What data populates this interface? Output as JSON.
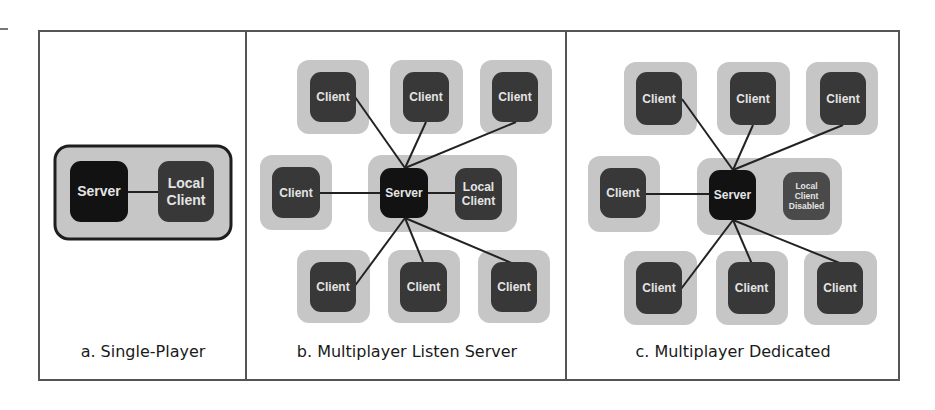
{
  "figure": {
    "colors": {
      "halo": "#c6c6c6",
      "client": "#383838",
      "server": "#121212",
      "disabled": "#4a4a4a",
      "line": "#222222",
      "label": "#e4e4e4",
      "frame": "#555555"
    },
    "panels": [
      {
        "id": "a",
        "caption": "a. Single-Player",
        "caption_x": 40,
        "caption_w": 206,
        "group": {
          "x": 55,
          "y": 146,
          "w": 176,
          "h": 93,
          "bordered": true
        },
        "halos": [],
        "nodes": [
          {
            "role": "server",
            "label": [
              "Server"
            ],
            "x": 70,
            "y": 161,
            "w": 58,
            "h": 61
          },
          {
            "role": "local-client",
            "label": [
              "Local",
              "Client"
            ],
            "x": 158,
            "y": 161,
            "w": 56,
            "h": 61
          }
        ],
        "links": [
          [
            128,
            192,
            158,
            192
          ]
        ]
      },
      {
        "id": "b",
        "caption": "b. Multiplayer Listen Server",
        "caption_x": 248,
        "caption_w": 318,
        "group": {
          "x": 368,
          "y": 155,
          "w": 149,
          "h": 77,
          "bordered": false
        },
        "halos": [
          {
            "x": 297,
            "y": 60,
            "w": 72,
            "h": 74
          },
          {
            "x": 390,
            "y": 60,
            "w": 73,
            "h": 74
          },
          {
            "x": 480,
            "y": 60,
            "w": 72,
            "h": 74
          },
          {
            "x": 260,
            "y": 155,
            "w": 72,
            "h": 75
          },
          {
            "x": 297,
            "y": 250,
            "w": 73,
            "h": 73
          },
          {
            "x": 388,
            "y": 250,
            "w": 72,
            "h": 73
          },
          {
            "x": 478,
            "y": 250,
            "w": 72,
            "h": 73
          }
        ],
        "nodes": [
          {
            "role": "client",
            "label": [
              "Client"
            ],
            "x": 310,
            "y": 72,
            "w": 46,
            "h": 50
          },
          {
            "role": "client",
            "label": [
              "Client"
            ],
            "x": 403,
            "y": 72,
            "w": 46,
            "h": 50
          },
          {
            "role": "client",
            "label": [
              "Client"
            ],
            "x": 492,
            "y": 72,
            "w": 46,
            "h": 50
          },
          {
            "role": "client",
            "label": [
              "Client"
            ],
            "x": 272,
            "y": 167,
            "w": 48,
            "h": 51
          },
          {
            "role": "server",
            "label": [
              "Server"
            ],
            "x": 380,
            "y": 168,
            "w": 48,
            "h": 50
          },
          {
            "role": "local-client",
            "label": [
              "Local",
              "Client"
            ],
            "x": 455,
            "y": 168,
            "w": 47,
            "h": 52
          },
          {
            "role": "client",
            "label": [
              "Client"
            ],
            "x": 310,
            "y": 262,
            "w": 46,
            "h": 50
          },
          {
            "role": "client",
            "label": [
              "Client"
            ],
            "x": 400,
            "y": 262,
            "w": 47,
            "h": 50
          },
          {
            "role": "client",
            "label": [
              "Client"
            ],
            "x": 491,
            "y": 262,
            "w": 46,
            "h": 50
          }
        ],
        "links": [
          [
            405,
            168,
            355,
            97
          ],
          [
            405,
            168,
            426,
            122
          ],
          [
            405,
            168,
            516,
            122
          ],
          [
            380,
            193,
            320,
            193
          ],
          [
            428,
            193,
            455,
            193
          ],
          [
            405,
            218,
            354,
            287
          ],
          [
            405,
            218,
            423,
            262
          ],
          [
            405,
            218,
            514,
            264
          ]
        ]
      },
      {
        "id": "c",
        "caption": "c. Multiplayer Dedicated",
        "caption_x": 568,
        "caption_w": 330,
        "group": {
          "x": 697,
          "y": 158,
          "w": 145,
          "h": 77,
          "bordered": false
        },
        "halos": [
          {
            "x": 624,
            "y": 62,
            "w": 73,
            "h": 73
          },
          {
            "x": 717,
            "y": 62,
            "w": 73,
            "h": 73
          },
          {
            "x": 806,
            "y": 62,
            "w": 72,
            "h": 73
          },
          {
            "x": 588,
            "y": 156,
            "w": 72,
            "h": 76
          },
          {
            "x": 624,
            "y": 251,
            "w": 73,
            "h": 74
          },
          {
            "x": 716,
            "y": 251,
            "w": 72,
            "h": 74
          },
          {
            "x": 804,
            "y": 251,
            "w": 73,
            "h": 74
          }
        ],
        "nodes": [
          {
            "role": "client",
            "label": [
              "Client"
            ],
            "x": 636,
            "y": 72,
            "w": 46,
            "h": 53
          },
          {
            "role": "client",
            "label": [
              "Client"
            ],
            "x": 730,
            "y": 72,
            "w": 46,
            "h": 53
          },
          {
            "role": "client",
            "label": [
              "Client"
            ],
            "x": 820,
            "y": 72,
            "w": 46,
            "h": 53
          },
          {
            "role": "client",
            "label": [
              "Client"
            ],
            "x": 600,
            "y": 168,
            "w": 46,
            "h": 50
          },
          {
            "role": "server",
            "label": [
              "Server"
            ],
            "x": 709,
            "y": 170,
            "w": 47,
            "h": 50
          },
          {
            "role": "disabled",
            "label": [
              "Local",
              "Client",
              "Disabled"
            ],
            "x": 783,
            "y": 172,
            "w": 47,
            "h": 48
          },
          {
            "role": "client",
            "label": [
              "Client"
            ],
            "x": 636,
            "y": 262,
            "w": 46,
            "h": 52
          },
          {
            "role": "client",
            "label": [
              "Client"
            ],
            "x": 728,
            "y": 262,
            "w": 47,
            "h": 52
          },
          {
            "role": "client",
            "label": [
              "Client"
            ],
            "x": 817,
            "y": 262,
            "w": 46,
            "h": 52
          }
        ],
        "links": [
          [
            733,
            170,
            682,
            99
          ],
          [
            733,
            170,
            753,
            125
          ],
          [
            733,
            170,
            843,
            125
          ],
          [
            709,
            194,
            646,
            194
          ],
          [
            733,
            220,
            681,
            289
          ],
          [
            733,
            220,
            752,
            264
          ],
          [
            733,
            220,
            842,
            264
          ]
        ]
      }
    ]
  }
}
